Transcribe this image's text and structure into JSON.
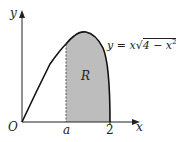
{
  "diagram": {
    "curve_equation": "y = x√(4 − x²)",
    "equation_parts": {
      "lhs": "y = x",
      "radicand": "4 − x",
      "exp": "2"
    },
    "region_label": "R",
    "axis_labels": {
      "x": "x",
      "y": "y",
      "origin": "O"
    },
    "x_ticks": [
      {
        "label": "a",
        "value": "a"
      },
      {
        "label": "2",
        "value": 2
      }
    ],
    "colors": {
      "curve": "#111111",
      "shade": "#bdbdbd",
      "axis": "#222222"
    }
  }
}
